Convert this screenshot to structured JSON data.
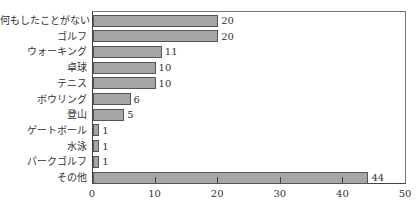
{
  "chart_data": {
    "type": "bar",
    "orientation": "horizontal",
    "title": "",
    "xlabel": "",
    "ylabel": "",
    "categories": [
      "何もしたことがない",
      "ゴルフ",
      "ウォーキング",
      "卓球",
      "テニス",
      "ボウリング",
      "登山",
      "ゲートボール",
      "水泳",
      "パークゴルフ",
      "その他"
    ],
    "values": [
      20,
      20,
      11,
      10,
      10,
      6,
      5,
      1,
      1,
      1,
      44
    ],
    "xlim": [
      0,
      50
    ],
    "xticks": [
      "0",
      "10",
      "20",
      "30",
      "40",
      "50"
    ],
    "grid": false,
    "legend": null,
    "bar_color": "#a6a6a6",
    "data_labels": true
  }
}
